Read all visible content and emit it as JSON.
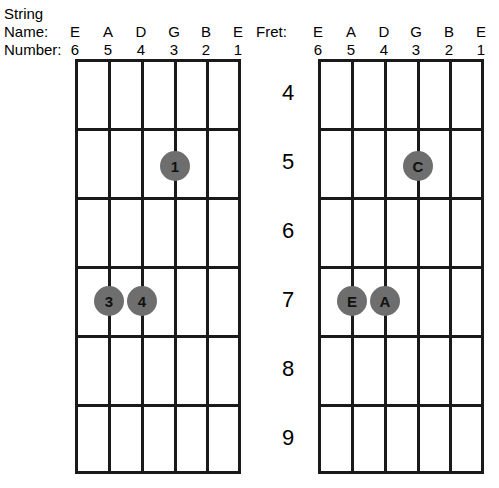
{
  "labels": {
    "string": "String",
    "name": "Name:",
    "number": "Number:",
    "fret": "Fret:"
  },
  "strings": {
    "names": [
      "E",
      "A",
      "D",
      "G",
      "B",
      "E"
    ],
    "numbers": [
      "6",
      "5",
      "4",
      "3",
      "2",
      "1"
    ]
  },
  "frets": [
    "4",
    "5",
    "6",
    "7",
    "8",
    "9"
  ],
  "colors": {
    "marker_fill": "#6e6e6e",
    "grid_line": "#1a1a1a",
    "text": "#000000",
    "background": "#ffffff"
  },
  "diagrams": [
    {
      "id": "left-fingering",
      "markers": [
        {
          "label": "1",
          "string_number": "3",
          "string_name": "G",
          "fret": "5"
        },
        {
          "label": "3",
          "string_number": "5",
          "string_name": "A",
          "fret": "7"
        },
        {
          "label": "4",
          "string_number": "4",
          "string_name": "D",
          "fret": "7"
        }
      ]
    },
    {
      "id": "right-notes",
      "markers": [
        {
          "label": "C",
          "string_number": "3",
          "string_name": "G",
          "fret": "5"
        },
        {
          "label": "E",
          "string_number": "5",
          "string_name": "A",
          "fret": "7"
        },
        {
          "label": "A",
          "string_number": "4",
          "string_name": "D",
          "fret": "7"
        }
      ]
    }
  ]
}
